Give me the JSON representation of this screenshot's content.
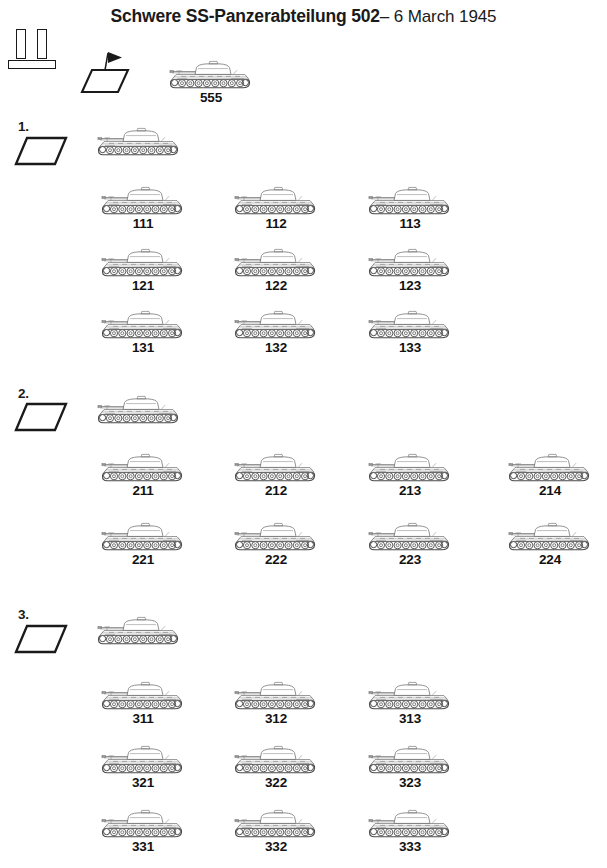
{
  "title": {
    "main": "Schwere SS-Panzerabteilung 502",
    "sub": "– 6 March 1945"
  },
  "symbols": {
    "battalion": "battalion-bars-symbol",
    "headquarters": "hq-flag-parallelogram-symbol",
    "company": "company-parallelogram-symbol",
    "tank": "tiger-ii-tank-silhouette"
  },
  "battalion_hq": {
    "label": "",
    "tanks": [
      {
        "number": "555",
        "x": 165,
        "y": 57
      }
    ]
  },
  "companies": [
    {
      "label": "1.",
      "marker": {
        "x": 14,
        "y": 133,
        "label_x": 18,
        "label_y": 119
      },
      "command_tank": {
        "number": "",
        "x": 93,
        "y": 124
      },
      "platoons": [
        {
          "tanks": [
            {
              "number": "111",
              "x": 97,
              "y": 183
            },
            {
              "number": "112",
              "x": 230,
              "y": 183
            },
            {
              "number": "113",
              "x": 364,
              "y": 183
            }
          ]
        },
        {
          "tanks": [
            {
              "number": "121",
              "x": 97,
              "y": 245
            },
            {
              "number": "122",
              "x": 230,
              "y": 245
            },
            {
              "number": "123",
              "x": 364,
              "y": 245
            }
          ]
        },
        {
          "tanks": [
            {
              "number": "131",
              "x": 97,
              "y": 307
            },
            {
              "number": "132",
              "x": 230,
              "y": 307
            },
            {
              "number": "133",
              "x": 364,
              "y": 307
            }
          ]
        }
      ]
    },
    {
      "label": "2.",
      "marker": {
        "x": 14,
        "y": 399,
        "label_x": 18,
        "label_y": 386
      },
      "command_tank": {
        "number": "",
        "x": 93,
        "y": 392
      },
      "platoons": [
        {
          "tanks": [
            {
              "number": "211",
              "x": 97,
              "y": 450
            },
            {
              "number": "212",
              "x": 230,
              "y": 450
            },
            {
              "number": "213",
              "x": 364,
              "y": 450
            },
            {
              "number": "214",
              "x": 504,
              "y": 450
            }
          ]
        },
        {
          "tanks": [
            {
              "number": "221",
              "x": 97,
              "y": 519
            },
            {
              "number": "222",
              "x": 230,
              "y": 519
            },
            {
              "number": "223",
              "x": 364,
              "y": 519
            },
            {
              "number": "224",
              "x": 504,
              "y": 519
            }
          ]
        }
      ]
    },
    {
      "label": "3.",
      "marker": {
        "x": 14,
        "y": 621,
        "label_x": 18,
        "label_y": 607
      },
      "command_tank": {
        "number": "",
        "x": 93,
        "y": 613
      },
      "platoons": [
        {
          "tanks": [
            {
              "number": "311",
              "x": 97,
              "y": 678
            },
            {
              "number": "312",
              "x": 230,
              "y": 678
            },
            {
              "number": "313",
              "x": 364,
              "y": 678
            }
          ]
        },
        {
          "tanks": [
            {
              "number": "321",
              "x": 97,
              "y": 742
            },
            {
              "number": "322",
              "x": 230,
              "y": 742
            },
            {
              "number": "323",
              "x": 364,
              "y": 742
            }
          ]
        },
        {
          "tanks": [
            {
              "number": "331",
              "x": 97,
              "y": 806
            },
            {
              "number": "332",
              "x": 230,
              "y": 806
            },
            {
              "number": "333",
              "x": 364,
              "y": 806
            }
          ]
        }
      ]
    }
  ],
  "colors": {
    "ink": "#1a1a1a",
    "tank_line": "#7d7d7d",
    "tank_line_dark": "#4a4a4a",
    "background": "#ffffff"
  }
}
